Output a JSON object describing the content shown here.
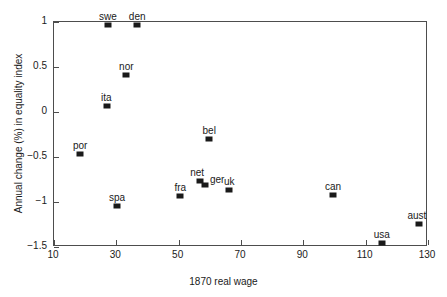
{
  "chart_data": {
    "type": "scatter",
    "title": "",
    "xlabel": "1870 real wage",
    "ylabel": "Annual change (%) in equality index",
    "xlim": [
      10,
      130
    ],
    "ylim": [
      -1.5,
      1
    ],
    "xticks": [
      "10",
      "30",
      "50",
      "70",
      "90",
      "110",
      "130"
    ],
    "xtick_values": [
      10,
      30,
      50,
      70,
      90,
      110,
      130
    ],
    "yticks": [
      "1",
      "0.5",
      "0",
      "−0.5",
      "−1",
      "−1.5"
    ],
    "ytick_values": [
      1,
      0.5,
      0,
      -0.5,
      -1,
      -1.5
    ],
    "grid": false,
    "legend": "none",
    "marker_color": "#1a1a1a",
    "axis_color": "#4d4d4d",
    "points": [
      {
        "label": "swe",
        "x": 27.3,
        "y": 0.97,
        "lx": 0,
        "ly": -13
      },
      {
        "label": "den",
        "x": 36.7,
        "y": 0.97,
        "lx": 0,
        "ly": -13
      },
      {
        "label": "nor",
        "x": 33.2,
        "y": 0.41,
        "lx": 0,
        "ly": -13
      },
      {
        "label": "ita",
        "x": 27.1,
        "y": 0.07,
        "lx": -1,
        "ly": -13
      },
      {
        "label": "por",
        "x": 18.4,
        "y": -0.47,
        "lx": 0,
        "ly": -13
      },
      {
        "label": "spa",
        "x": 30.2,
        "y": -1.04,
        "lx": 0,
        "ly": -13
      },
      {
        "label": "fra",
        "x": 50.5,
        "y": -0.93,
        "lx": 0,
        "ly": -13
      },
      {
        "label": "net",
        "x": 56.9,
        "y": -0.77,
        "lx": -3,
        "ly": -13
      },
      {
        "label": "ger",
        "x": 58.5,
        "y": -0.81,
        "lx": 12,
        "ly": -10
      },
      {
        "label": "uk",
        "x": 66.2,
        "y": -0.87,
        "lx": 0,
        "ly": -13
      },
      {
        "label": "bel",
        "x": 59.8,
        "y": -0.3,
        "lx": 0,
        "ly": -13
      },
      {
        "label": "can",
        "x": 99.5,
        "y": -0.92,
        "lx": 0,
        "ly": -13
      },
      {
        "label": "usa",
        "x": 115.2,
        "y": -1.46,
        "lx": 0,
        "ly": -13
      },
      {
        "label": "aust",
        "x": 127.1,
        "y": -1.24,
        "lx": -2,
        "ly": -13
      }
    ]
  }
}
